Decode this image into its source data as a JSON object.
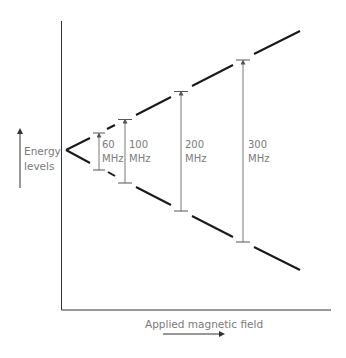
{
  "diagram": {
    "y_axis_label_line1": "Energy",
    "y_axis_label_line2": "levels",
    "x_axis_label": "Applied magnetic field",
    "colors": {
      "lines": "#1a1a1a",
      "axes": "#333333",
      "text": "#7a7a7a",
      "transition_arrows": "#555555"
    },
    "transitions": [
      {
        "freq": "60",
        "unit": "MHz"
      },
      {
        "freq": "100",
        "unit": "MHz"
      },
      {
        "freq": "200",
        "unit": "MHz"
      },
      {
        "freq": "300",
        "unit": "MHz"
      }
    ]
  }
}
